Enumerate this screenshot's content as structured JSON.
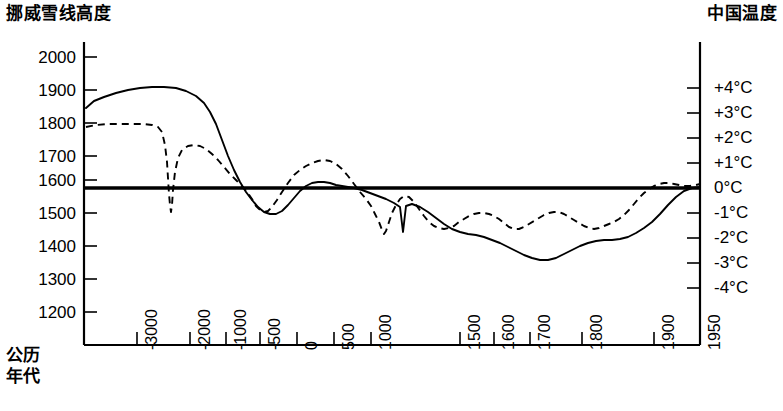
{
  "chart_data": {
    "type": "line",
    "title": "",
    "left_axis_title": "挪威雪线高度",
    "right_axis_title": "中国温度",
    "xlabel_lines": [
      "公历",
      "年代"
    ],
    "xlabel": "公历年代",
    "ylabel": "挪威雪线高度",
    "y2label": "中国温度",
    "grid": false,
    "legend": "none",
    "left_ticks": [
      "2000",
      "1900",
      "1800",
      "1700",
      "1600",
      "1500",
      "1400",
      "1300",
      "1200"
    ],
    "left_tick_values": [
      2000,
      1900,
      1800,
      1700,
      1600,
      1500,
      1400,
      1300,
      1200
    ],
    "ylim": [
      1150,
      2050
    ],
    "right_ticks": [
      "+4°C",
      "+3°C",
      "+2°C",
      "+1°C",
      "0°C",
      "-1°C",
      "-2°C",
      "-3°C",
      "-4°C"
    ],
    "right_tick_values": [
      4,
      3,
      2,
      1,
      0,
      -1,
      -2,
      -3,
      -4
    ],
    "y2lim": [
      -5,
      5
    ],
    "x_ticks": [
      "-3000",
      "-2000",
      "-1000",
      "-500",
      "0",
      "500",
      "1000",
      "1500",
      "1600",
      "1700",
      "1800",
      "1900",
      "1950"
    ],
    "x_tick_values": [
      -3000,
      -2000,
      -1000,
      -500,
      0,
      500,
      1000,
      1500,
      1600,
      1700,
      1800,
      1900,
      1950
    ],
    "zero_reference_line": {
      "label": "0°C / 1570m",
      "value": 0
    },
    "series": [
      {
        "name": "挑威雪线高度",
        "style": "solid",
        "points_px": "86,108 94,101 104,97 116,93 128,90 140,88 152,87 164,87 176,88 186,91 196,96 204,103 210,112 216,124 222,140 228,156 234,170 240,182 246,192 252,200 258,207 264,212 270,214 276,214 282,211 288,205 294,198 300,191 306,186 312,183 318,182 324,182 330,183 336,185 342,186 348,187 354,188 362,190 370,193 378,196 386,199 394,203 400,207 403,232 406,206 412,204 420,207 428,212 436,218 444,224 452,229 460,232 468,234 476,235 484,237 492,240 500,243 508,247 516,251 524,255 532,258 540,260 548,260 556,258 564,254 572,250 580,246 588,243 596,241 604,240 612,240 620,239 628,237 636,233 644,228 652,222 660,214 668,205 676,197 684,191 692,188 700,187"
      },
      {
        "name": "中国温度",
        "style": "dashed",
        "points_px": "86,127 96,125 108,124 120,124 132,124 144,124 152,125 158,127 162,132 165,145 167,162 168,178 169,194 170,205 171,212 172,205 173,190 175,172 178,158 182,150 188,146 194,145 200,146 206,149 212,154 218,160 224,167 230,174 236,180 242,186 247,192 252,199 256,206 260,210 264,212 268,211 272,207 277,200 282,192 288,183 294,175 300,170 306,166 312,163 318,161 324,160 330,161 336,164 342,169 348,176 354,184 360,192 366,199 371,206 375,214 379,222 382,230 384,234 386,231 389,222 392,213 396,205 400,199 404,196 409,197 414,202 419,209 424,216 429,222 434,226 439,228 444,229 449,228 454,226 459,222 464,219 469,216 474,214 479,213 484,213 489,214 494,216 499,219 504,223 509,227 514,229 519,229 524,227 529,224 534,221 539,218 544,215 549,213 554,212 559,212 564,214 569,217 574,220 579,223 584,226 589,228 594,229 599,228 604,226 609,224 614,222 619,219 624,215 629,210 634,204 639,198 644,193 649,189 654,186 659,184 664,183 669,183 674,184 679,185 684,186 690,186 696,185 700,184"
      }
    ],
    "geometry": {
      "plot_left_px": 84,
      "plot_right_px": 700,
      "plot_bottom_px": 345,
      "plot_top_px": 42,
      "zero_line_y_px": 188,
      "left_tick_y_px": [
        57,
        90,
        123,
        156,
        180,
        213,
        246,
        279,
        312
      ],
      "right_tick_y_px": [
        88,
        113,
        138,
        163,
        188,
        213,
        238,
        263,
        288
      ],
      "x_tick_x_px": [
        137,
        190,
        226,
        260,
        297,
        334,
        371,
        460,
        494,
        530,
        582,
        654,
        700
      ]
    }
  }
}
